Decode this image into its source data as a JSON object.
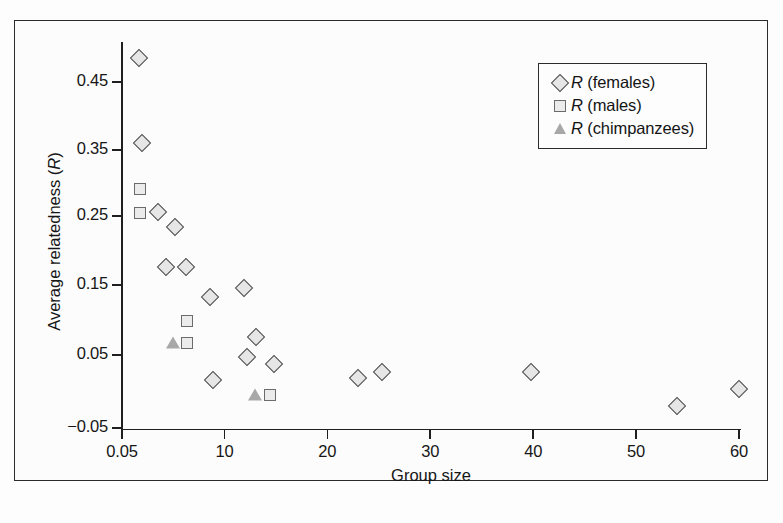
{
  "figure": {
    "background_color": "#fdfdfd",
    "frame_color": "#2b2b2b",
    "caption_fragment": ""
  },
  "axes": {
    "x_title": "Group size",
    "y_title_prefix": "Average relatedness (",
    "y_title_italic": "R",
    "y_title_suffix": ")",
    "x_ticks": [
      "0.05",
      "10",
      "20",
      "30",
      "40",
      "50",
      "60"
    ],
    "y_ticks": [
      "0.45",
      "0.35",
      "0.25",
      "0.15",
      "0.05",
      "−0.05"
    ]
  },
  "legend": {
    "entries": [
      {
        "marker": "diamond",
        "italic": "R",
        "label": " (females)"
      },
      {
        "marker": "square",
        "italic": "R",
        "label": " (males)"
      },
      {
        "marker": "triangle",
        "italic": "R",
        "label": " (chimpanzees)"
      }
    ]
  },
  "chart_data": {
    "type": "scatter",
    "title": "",
    "xlabel": "Group size",
    "ylabel": "Average relatedness (R)",
    "xlim": [
      0.05,
      60
    ],
    "ylim": [
      -0.05,
      0.52
    ],
    "xticks": [
      0.05,
      10,
      20,
      30,
      40,
      50,
      60
    ],
    "yticks": [
      0.45,
      0.35,
      0.25,
      0.15,
      0.05,
      -0.05
    ],
    "grid": false,
    "legend_position": "upper right",
    "series": [
      {
        "name": "R (females)",
        "marker": "diamond",
        "color": "#e6e6e6",
        "edge_color": "#4d4d4d",
        "points": [
          {
            "x": 1.7,
            "y": 0.485
          },
          {
            "x": 2.0,
            "y": 0.362
          },
          {
            "x": 3.5,
            "y": 0.262
          },
          {
            "x": 5.2,
            "y": 0.24
          },
          {
            "x": 4.3,
            "y": 0.182
          },
          {
            "x": 6.3,
            "y": 0.183
          },
          {
            "x": 8.6,
            "y": 0.14
          },
          {
            "x": 11.9,
            "y": 0.152
          },
          {
            "x": 13.1,
            "y": 0.082
          },
          {
            "x": 12.2,
            "y": 0.053
          },
          {
            "x": 14.8,
            "y": 0.043
          },
          {
            "x": 8.9,
            "y": 0.02
          },
          {
            "x": 23.0,
            "y": 0.022
          },
          {
            "x": 25.3,
            "y": 0.031
          },
          {
            "x": 39.8,
            "y": 0.031
          },
          {
            "x": 54.0,
            "y": -0.018
          },
          {
            "x": 60.0,
            "y": 0.006
          }
        ]
      },
      {
        "name": "R (males)",
        "marker": "square",
        "color": "#ebebeb",
        "edge_color": "#6b6b6b",
        "points": [
          {
            "x": 1.8,
            "y": 0.295
          },
          {
            "x": 1.8,
            "y": 0.26
          },
          {
            "x": 6.4,
            "y": 0.105
          },
          {
            "x": 6.4,
            "y": 0.073
          },
          {
            "x": 14.4,
            "y": -0.003
          }
        ]
      },
      {
        "name": "R (chimpanzees)",
        "marker": "triangle",
        "color": "#a8a8a8",
        "edge_color": "#a8a8a8",
        "points": [
          {
            "x": 5.0,
            "y": 0.073
          },
          {
            "x": 13.0,
            "y": -0.003
          }
        ]
      }
    ]
  }
}
